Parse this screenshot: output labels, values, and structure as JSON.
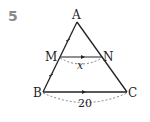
{
  "problem_number": "5",
  "points": {
    "A": "A",
    "B": "B",
    "C": "C",
    "M": "M",
    "N": "N"
  },
  "labels": {
    "mn_length": "x",
    "bc_length": "20"
  },
  "colors": {
    "line": "#222222",
    "number": "#8a8a8a",
    "dashed": "#666666"
  }
}
